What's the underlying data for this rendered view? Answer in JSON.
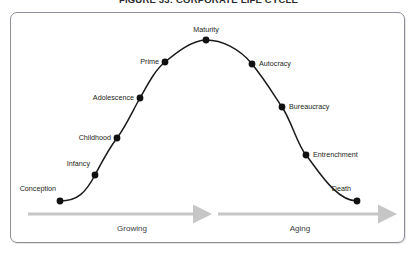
{
  "figure": {
    "title": "FIGURE 33: CORPORATE LIFE CYCLE",
    "border_color": "#8c9096",
    "background_color": "#ffffff"
  },
  "chart_data": {
    "type": "line",
    "title": "FIGURE 33: CORPORATE LIFE CYCLE",
    "xlabel": "",
    "ylabel": "",
    "grid": false,
    "legend": "none",
    "curve_color": "#1a1a1a",
    "marker_color": "#111111",
    "categories": [
      "Conception",
      "Infancy",
      "Childhood",
      "Adolescence",
      "Prime",
      "Maturity",
      "Autocracy",
      "Bureaucracy",
      "Entrenchment",
      "Death"
    ],
    "values": [
      4,
      20,
      48,
      70,
      86,
      95,
      84,
      62,
      34,
      4
    ],
    "xlim": [
      0,
      100
    ],
    "ylim": [
      0,
      100
    ],
    "points": [
      {
        "label": "Conception",
        "x": 60,
        "y": 201,
        "lx": 56,
        "ly": 189,
        "anchor": "right-anchor"
      },
      {
        "label": "Infancy",
        "x": 95,
        "y": 175,
        "lx": 90,
        "ly": 164,
        "anchor": "right-anchor"
      },
      {
        "label": "Childhood",
        "x": 117,
        "y": 138,
        "lx": 111,
        "ly": 138,
        "anchor": "right-anchor"
      },
      {
        "label": "Adolescence",
        "x": 140,
        "y": 98,
        "lx": 134,
        "ly": 98,
        "anchor": "right-anchor"
      },
      {
        "label": "Prime",
        "x": 165,
        "y": 62,
        "lx": 159,
        "ly": 62,
        "anchor": "right-anchor"
      },
      {
        "label": "Maturity",
        "x": 206,
        "y": 40,
        "lx": 206,
        "ly": 30,
        "anchor": "center-anchor"
      },
      {
        "label": "Autocracy",
        "x": 252,
        "y": 64,
        "lx": 259,
        "ly": 64,
        "anchor": "left-anchor"
      },
      {
        "label": "Bureaucracy",
        "x": 282,
        "y": 107,
        "lx": 289,
        "ly": 107,
        "anchor": "left-anchor"
      },
      {
        "label": "Entrenchment",
        "x": 306,
        "y": 155,
        "lx": 313,
        "ly": 155,
        "anchor": "left-anchor"
      },
      {
        "label": "Death",
        "x": 357,
        "y": 201,
        "lx": 351,
        "ly": 189,
        "anchor": "right-anchor"
      }
    ]
  },
  "phases": [
    {
      "name": "Growing",
      "label_x": 132,
      "label_y": 224,
      "arrow_x1": 28,
      "arrow_x2": 203,
      "arrow_y": 214
    },
    {
      "name": "Aging",
      "label_x": 300,
      "label_y": 224,
      "arrow_x1": 218,
      "arrow_x2": 388,
      "arrow_y": 214
    }
  ],
  "colors": {
    "arrow": "#c6c6c6",
    "text": "#231f20",
    "phase_text": "#3a3a3a",
    "curve": "#1a1a1a"
  }
}
